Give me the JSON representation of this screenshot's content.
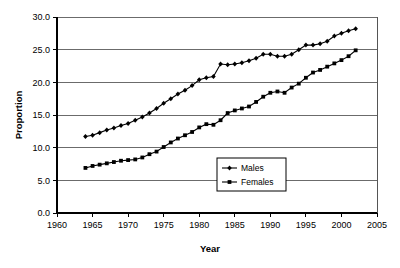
{
  "chart_data": {
    "type": "line",
    "title": "",
    "xlabel": "Year",
    "ylabel": "Proportion",
    "xlim": [
      1960,
      2005
    ],
    "ylim": [
      0.0,
      30.0
    ],
    "xticks": [
      1960,
      1965,
      1970,
      1975,
      1980,
      1985,
      1990,
      1995,
      2000,
      2005
    ],
    "xtick_labels": [
      "1960",
      "1965",
      "1970",
      "1975",
      "1980",
      "1985",
      "1990",
      "1995",
      "2000",
      "2005"
    ],
    "yticks": [
      0.0,
      5.0,
      10.0,
      15.0,
      20.0,
      25.0,
      30.0
    ],
    "ytick_labels": [
      "0.0",
      "5.0",
      "10.0",
      "15.0",
      "20.0",
      "25.0",
      "30.0"
    ],
    "grid": "horizontal",
    "legend_position": "lower-right-inside",
    "x": [
      1964,
      1965,
      1966,
      1967,
      1968,
      1969,
      1970,
      1971,
      1972,
      1973,
      1974,
      1975,
      1976,
      1977,
      1978,
      1979,
      1980,
      1981,
      1982,
      1983,
      1984,
      1985,
      1986,
      1987,
      1988,
      1989,
      1990,
      1991,
      1992,
      1993,
      1994,
      1995,
      1996,
      1997,
      1998,
      1999,
      2000,
      2001,
      2002
    ],
    "series": [
      {
        "name": "Males",
        "marker": "diamond",
        "values": [
          11.7,
          11.9,
          12.3,
          12.7,
          13.0,
          13.4,
          13.7,
          14.2,
          14.7,
          15.3,
          16.0,
          16.8,
          17.5,
          18.2,
          18.8,
          19.5,
          20.4,
          20.7,
          20.9,
          22.8,
          22.7,
          22.8,
          23.0,
          23.3,
          23.7,
          24.3,
          24.3,
          24.0,
          24.0,
          24.3,
          25.0,
          25.7,
          25.7,
          25.9,
          26.3,
          27.1,
          27.5,
          27.9,
          28.2
        ]
      },
      {
        "name": "Females",
        "marker": "square",
        "values": [
          6.9,
          7.2,
          7.4,
          7.6,
          7.8,
          8.0,
          8.1,
          8.2,
          8.5,
          9.0,
          9.4,
          10.1,
          10.8,
          11.4,
          11.9,
          12.4,
          13.1,
          13.6,
          13.5,
          14.2,
          15.3,
          15.7,
          16.0,
          16.3,
          17.0,
          17.8,
          18.4,
          18.6,
          18.4,
          19.2,
          19.8,
          20.7,
          21.5,
          21.9,
          22.4,
          22.9,
          23.4,
          24.0,
          24.9
        ]
      }
    ]
  },
  "legend": {
    "entries": [
      {
        "label": "Males"
      },
      {
        "label": "Females"
      }
    ]
  },
  "axes": {
    "x_title": "Year",
    "y_title": "Proportion"
  },
  "colors": {
    "series_stroke": "#000000",
    "grid": "#6b6b6b",
    "axis": "#000000",
    "background": "#ffffff"
  }
}
